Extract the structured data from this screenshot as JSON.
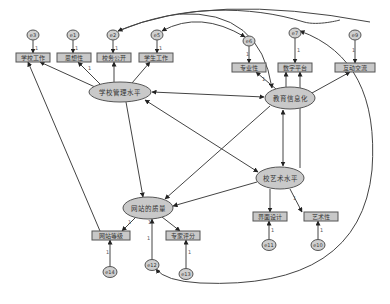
{
  "diagram": {
    "type": "structural-equation-model",
    "latent_variables": [
      {
        "id": "L1",
        "label": "学校管理水平",
        "x": 120,
        "y": 92,
        "rx": 31,
        "ry": 10
      },
      {
        "id": "L2",
        "label": "教育信息化",
        "x": 290,
        "y": 98,
        "rx": 25,
        "ry": 11
      },
      {
        "id": "L3",
        "label": "校艺术水平",
        "x": 280,
        "y": 178,
        "rx": 24,
        "ry": 11
      },
      {
        "id": "L4",
        "label": "网站的质量",
        "x": 148,
        "y": 208,
        "rx": 25,
        "ry": 11
      }
    ],
    "observed_variables": [
      {
        "id": "O1",
        "label": "学校工作",
        "x": 16,
        "y": 53,
        "w": 34,
        "h": 9
      },
      {
        "id": "O2",
        "label": "思想性",
        "x": 57,
        "y": 53,
        "w": 34,
        "h": 9
      },
      {
        "id": "O3",
        "label": "校务公开",
        "x": 97,
        "y": 53,
        "w": 34,
        "h": 9
      },
      {
        "id": "O4",
        "label": "学生工作",
        "x": 139,
        "y": 53,
        "w": 34,
        "h": 9
      },
      {
        "id": "O5",
        "label": "专业性",
        "x": 232,
        "y": 63,
        "w": 34,
        "h": 9
      },
      {
        "id": "O6",
        "label": "数字平台",
        "x": 278,
        "y": 63,
        "w": 34,
        "h": 9
      },
      {
        "id": "O7",
        "label": "互动交流",
        "x": 335,
        "y": 63,
        "w": 40,
        "h": 9
      },
      {
        "id": "O8",
        "label": "界面设计",
        "x": 253,
        "y": 212,
        "w": 34,
        "h": 9
      },
      {
        "id": "O9",
        "label": "艺术性",
        "x": 304,
        "y": 212,
        "w": 34,
        "h": 9
      },
      {
        "id": "O10",
        "label": "网站等级",
        "x": 92,
        "y": 231,
        "w": 38,
        "h": 9
      },
      {
        "id": "O11",
        "label": "专家评分",
        "x": 166,
        "y": 231,
        "w": 34,
        "h": 9
      }
    ],
    "error_terms": [
      {
        "id": "e3",
        "label": "e3",
        "x": 33,
        "y": 35
      },
      {
        "id": "e1",
        "label": "e1",
        "x": 73,
        "y": 35
      },
      {
        "id": "e2",
        "label": "e2",
        "x": 113,
        "y": 35
      },
      {
        "id": "e5",
        "label": "e5",
        "x": 157,
        "y": 35
      },
      {
        "id": "e6",
        "label": "e6",
        "x": 249,
        "y": 41
      },
      {
        "id": "e7",
        "label": "e7",
        "x": 295,
        "y": 33
      },
      {
        "id": "e9",
        "label": "e9",
        "x": 355,
        "y": 35
      },
      {
        "id": "e11",
        "label": "e11",
        "x": 269,
        "y": 245
      },
      {
        "id": "e10",
        "label": "e10",
        "x": 318,
        "y": 245
      },
      {
        "id": "e14",
        "label": "e14",
        "x": 110,
        "y": 272
      },
      {
        "id": "e12",
        "label": "e12",
        "x": 152,
        "y": 265
      },
      {
        "id": "e13",
        "label": "e13",
        "x": 186,
        "y": 274
      }
    ],
    "path_labels": {
      "fixed_loading": "1"
    }
  }
}
